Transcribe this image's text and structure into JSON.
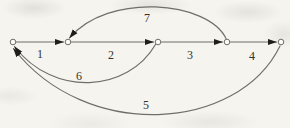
{
  "figure": {
    "type": "directed-graph",
    "colors": {
      "paper": "#f5f4ee",
      "line": "#6f6e68",
      "arrow": "#1f1e1a",
      "label": "#34332e"
    },
    "nodes": [
      {
        "id": "n1"
      },
      {
        "id": "n2"
      },
      {
        "id": "n3"
      },
      {
        "id": "n4"
      },
      {
        "id": "n5"
      }
    ],
    "edges": [
      {
        "label": "1",
        "from": "n1",
        "to": "n2",
        "shape": "straight"
      },
      {
        "label": "2",
        "from": "n2",
        "to": "n3",
        "shape": "straight"
      },
      {
        "label": "3",
        "from": "n3",
        "to": "n4",
        "shape": "straight"
      },
      {
        "label": "4",
        "from": "n4",
        "to": "n5",
        "shape": "straight"
      },
      {
        "label": "5",
        "from": "n5",
        "to": "n1",
        "shape": "arc-below-deep"
      },
      {
        "label": "6",
        "from": "n3",
        "to": "n1",
        "shape": "arc-below"
      },
      {
        "label": "7",
        "from": "n4",
        "to": "n2",
        "shape": "arc-above"
      }
    ]
  }
}
